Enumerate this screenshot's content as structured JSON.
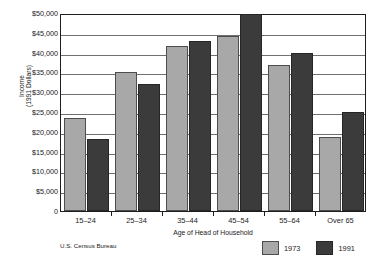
{
  "chart_data": {
    "type": "bar",
    "title": "",
    "subtitle": "",
    "categories": [
      "15–24",
      "25–34",
      "35–44",
      "45–54",
      "55–64",
      "Over 65"
    ],
    "series": [
      {
        "name": "1973",
        "color": "#a8a8a8",
        "values": [
          23400,
          35000,
          41700,
          44100,
          36900,
          18600
        ]
      },
      {
        "name": "1991",
        "color": "#3b3b3b",
        "values": [
          18100,
          32200,
          42900,
          49700,
          40000,
          25000
        ]
      }
    ],
    "xlabel": "Age of Head of Household",
    "ylabel": "Income\n(1991 Dollars)",
    "ylabel_line1": "Income",
    "ylabel_line2": "(1991 Dollars)",
    "ylim": [
      0,
      50000
    ],
    "ytick_values": [
      0,
      5000,
      10000,
      15000,
      20000,
      25000,
      30000,
      35000,
      40000,
      45000,
      50000
    ],
    "ytick_labels": [
      "0",
      "$5,000",
      "$10,000",
      "$15,000",
      "$20,000",
      "$25,000",
      "$30,000",
      "$35,000",
      "$40,000",
      "$45,000",
      "$50,000"
    ],
    "grid": true,
    "grid_axis": "y",
    "legend_position": "bottom-right",
    "source_note": "U.S. Census Bureau"
  },
  "legend": {
    "items": [
      {
        "label": "1973"
      },
      {
        "label": "1991"
      }
    ]
  },
  "footer": {
    "source": "U.S. Census Bureau"
  }
}
